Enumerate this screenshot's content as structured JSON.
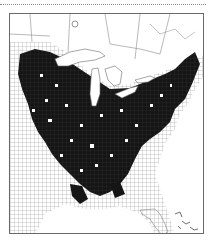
{
  "map": {
    "type": "county-distribution-map",
    "region": "eastern-united-states",
    "legend": [],
    "colors": {
      "present": "#111111",
      "absent": "#ffffff",
      "county_lines": "#7a7a7a",
      "frame": "#6a6a6a",
      "water": "#ffffff"
    },
    "features": [
      {
        "name": "great-lakes"
      },
      {
        "name": "florida-peninsula"
      },
      {
        "name": "gulf-coast"
      },
      {
        "name": "atlantic-coast"
      },
      {
        "name": "caribbean-islands"
      },
      {
        "name": "canada-provinces"
      }
    ]
  }
}
